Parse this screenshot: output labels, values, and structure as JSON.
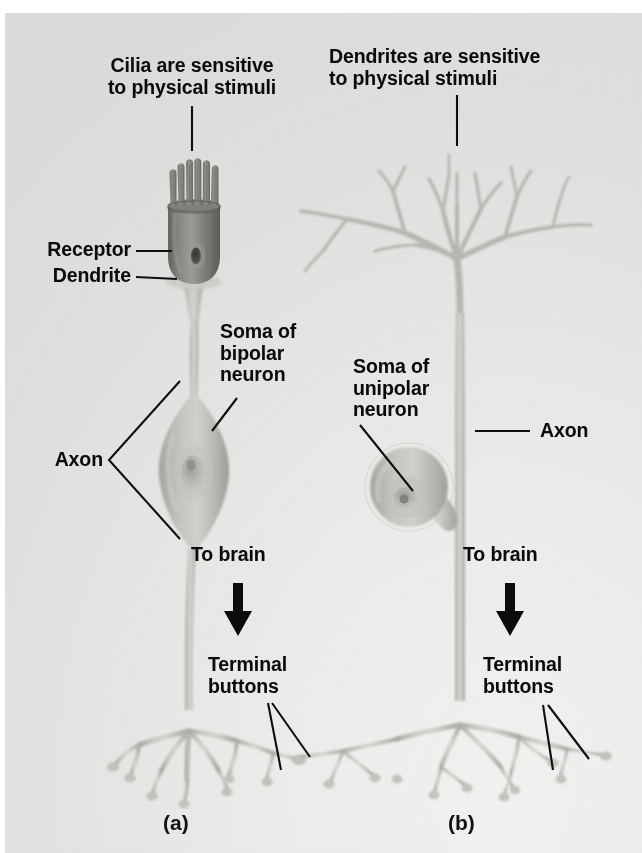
{
  "figure": {
    "background_color": "#e6e5e3",
    "text_color": "#0b0b0b",
    "cell_color": "#b9b8b4",
    "receptor_color": "#7d7c78"
  },
  "panels": [
    {
      "id": "a",
      "caption": "(a)",
      "neuron_type": "bipolar",
      "labels": {
        "top": "Cilia are sensitive\nto physical stimuli",
        "receptor": "Receptor",
        "dendrite": "Dendrite",
        "soma": "Soma of\nbipolar\nneuron",
        "axon": "Axon",
        "to_brain": "To brain",
        "terminal_buttons": "Terminal\nbuttons"
      }
    },
    {
      "id": "b",
      "caption": "(b)",
      "neuron_type": "unipolar",
      "labels": {
        "top": "Dendrites are sensitive\nto physical stimuli",
        "soma": "Soma of\nunipolar\nneuron",
        "axon": "Axon",
        "to_brain": "To brain",
        "terminal_buttons": "Terminal\nbuttons"
      }
    }
  ]
}
